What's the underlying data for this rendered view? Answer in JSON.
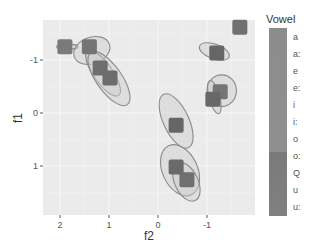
{
  "chart_data": {
    "type": "scatter",
    "title": "",
    "xlabel": "f2",
    "ylabel": "f1",
    "x_reversed": true,
    "y_reversed": true,
    "xlim": [
      2.3,
      -1.95
    ],
    "ylim": [
      -1.75,
      1.92
    ],
    "x_ticks": [
      2,
      1,
      0,
      -1
    ],
    "x_tick_labels": [
      "2",
      "1",
      "0",
      "-1"
    ],
    "y_ticks": [
      -1,
      0,
      1
    ],
    "y_tick_labels": [
      "-1",
      "0",
      "1"
    ],
    "grid": true,
    "legend": {
      "title": "Vowel",
      "position": "right",
      "entries": [
        "a",
        "a:",
        "e",
        "e:",
        "i",
        "i:",
        "o",
        "o:",
        "Q",
        "u",
        "u:"
      ]
    },
    "points": [
      {
        "vowel": "e",
        "f2": 1.9,
        "f1": -1.25,
        "color": "#7a7a7a"
      },
      {
        "vowel": "i",
        "f2": 1.4,
        "f1": -1.25,
        "color": "#747474"
      },
      {
        "vowel": "e:",
        "f2": 1.18,
        "f1": -0.85,
        "color": "#6e6e6e"
      },
      {
        "vowel": "i:",
        "f2": 0.98,
        "f1": -0.66,
        "color": "#6c6c6c"
      },
      {
        "vowel": "o",
        "f2": -1.67,
        "f1": -1.62,
        "color": "#707070"
      },
      {
        "vowel": "u",
        "f2": -1.2,
        "f1": -1.13,
        "color": "#666666"
      },
      {
        "vowel": "a:",
        "f2": -1.27,
        "f1": -0.4,
        "color": "#757575"
      },
      {
        "vowel": "a",
        "f2": -1.12,
        "f1": -0.26,
        "color": "#686868"
      },
      {
        "vowel": "Q",
        "f2": -0.37,
        "f1": 0.23,
        "color": "#666666"
      },
      {
        "vowel": "o:",
        "f2": -0.37,
        "f1": 1.02,
        "color": "#6a6a6a"
      },
      {
        "vowel": "u:",
        "f2": -0.59,
        "f1": 1.26,
        "color": "#6f6f6f"
      }
    ],
    "ellipses": [
      {
        "cx": 1.85,
        "cy": -1.25,
        "rx": 0.22,
        "ry": 0.05,
        "angle": 0
      },
      {
        "cx": 1.35,
        "cy": -1.18,
        "rx": 0.38,
        "ry": 0.25,
        "angle": -20
      },
      {
        "cx": 1.12,
        "cy": -0.75,
        "rx": 0.55,
        "ry": 0.18,
        "angle": 55
      },
      {
        "cx": 1.0,
        "cy": -0.65,
        "rx": 0.65,
        "ry": 0.24,
        "angle": 55
      },
      {
        "cx": -1.15,
        "cy": -1.16,
        "rx": 0.32,
        "ry": 0.14,
        "angle": 20
      },
      {
        "cx": -1.3,
        "cy": -0.42,
        "rx": 0.3,
        "ry": 0.3,
        "angle": 0
      },
      {
        "cx": -1.15,
        "cy": -0.3,
        "rx": 0.35,
        "ry": 0.1,
        "angle": 75
      },
      {
        "cx": -0.37,
        "cy": 0.15,
        "rx": 0.6,
        "ry": 0.24,
        "angle": 65
      },
      {
        "cx": -0.45,
        "cy": 1.08,
        "rx": 0.55,
        "ry": 0.33,
        "angle": 65
      },
      {
        "cx": -0.58,
        "cy": 1.3,
        "rx": 0.42,
        "ry": 0.22,
        "angle": 65
      }
    ],
    "legend_colorbar": {
      "top_color": "#8e8e8e",
      "bottom_color": "#7a7a7a",
      "split_after_index": 6
    }
  }
}
